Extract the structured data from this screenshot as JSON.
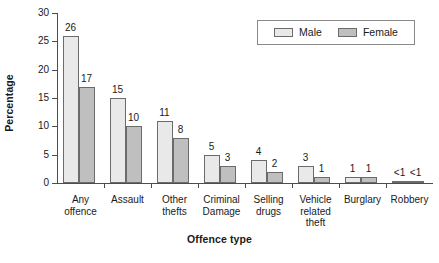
{
  "chart_data": {
    "type": "bar",
    "title": "",
    "xlabel": "Offence type",
    "ylabel": "Percentage",
    "ylim": [
      0,
      30
    ],
    "yticks": [
      0,
      5,
      10,
      15,
      20,
      25,
      30
    ],
    "ytick_labels": [
      "0",
      "5",
      "10",
      "15",
      "20",
      "25",
      "30"
    ],
    "grid": false,
    "legend_position": "top-right",
    "categories": [
      "Any\noffence",
      "Assault",
      "Other\nthefts",
      "Criminal\nDamage",
      "Selling\ndrugs",
      "Vehicle\nrelated\ntheft",
      "Burglary",
      "Robbery"
    ],
    "series": [
      {
        "name": "Male",
        "color": "#e9e9e9",
        "values": [
          26,
          15,
          11,
          5,
          4,
          3,
          1,
          0.4
        ],
        "labels": [
          "26",
          "15",
          "11",
          "5",
          "4",
          "3",
          "1",
          "<1"
        ]
      },
      {
        "name": "Female",
        "color": "#bfbfbf",
        "values": [
          17,
          10,
          8,
          3,
          2,
          1,
          1,
          0.4
        ],
        "labels": [
          "17",
          "10",
          "8",
          "3",
          "2",
          "1",
          "1",
          "<1"
        ]
      }
    ]
  },
  "legend": {
    "items": [
      {
        "label": "Male",
        "swatch": "male"
      },
      {
        "label": "Female",
        "swatch": "female"
      }
    ]
  }
}
